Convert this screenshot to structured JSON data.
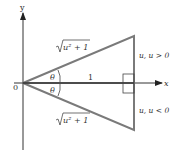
{
  "diagram": {
    "axes": {
      "x_label": "x",
      "y_label": "y",
      "origin_label": "0"
    },
    "angles": {
      "upper": "θ",
      "lower": "θ"
    },
    "base_label": "1",
    "hypotenuse_upper": {
      "radicand": "u² + 1"
    },
    "hypotenuse_lower": {
      "radicand": "u² + 1"
    },
    "side_upper": "u, u > 0",
    "side_lower": "u, u < 0",
    "colors": {
      "triangle": "#7a7a7a",
      "axes": "#222222"
    }
  }
}
